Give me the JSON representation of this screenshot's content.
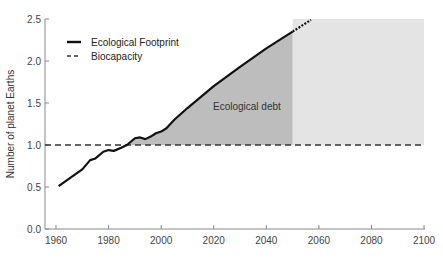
{
  "chart_data": {
    "type": "line",
    "title": "",
    "xlabel": "",
    "ylabel": "Number of planet Earths",
    "xlim": [
      1955,
      2100
    ],
    "ylim": [
      0.0,
      2.5
    ],
    "x_ticks": [
      1960,
      1980,
      2000,
      2020,
      2040,
      2060,
      2080,
      2100
    ],
    "y_ticks": [
      0.0,
      0.5,
      1.0,
      1.5,
      2.0,
      2.5
    ],
    "x_tick_labels": [
      "1960",
      "1980",
      "2000",
      "2020",
      "2040",
      "2060",
      "2080",
      "2100"
    ],
    "y_tick_labels": [
      "0.0",
      "0.5",
      "1.0",
      "1.5",
      "2.0",
      "2.5"
    ],
    "grid": false,
    "legend_position": "upper left",
    "legend": [
      {
        "label": "Ecological Footprint",
        "style": "solid"
      },
      {
        "label": "Biocapacity",
        "style": "dashed"
      }
    ],
    "series": [
      {
        "name": "Ecological Footprint",
        "style": "solid",
        "x": [
          1961,
          1965,
          1970,
          1973,
          1975,
          1978,
          1980,
          1982,
          1985,
          1987,
          1990,
          1992,
          1994,
          1996,
          1998,
          2000,
          2002,
          2005,
          2010,
          2020,
          2030,
          2040,
          2050
        ],
        "values": [
          0.51,
          0.6,
          0.71,
          0.82,
          0.84,
          0.92,
          0.94,
          0.93,
          0.97,
          1.0,
          1.08,
          1.09,
          1.07,
          1.1,
          1.14,
          1.16,
          1.2,
          1.3,
          1.44,
          1.7,
          1.93,
          2.15,
          2.35
        ]
      },
      {
        "name": "Ecological Footprint (projection)",
        "style": "dotted",
        "x": [
          2050,
          2057
        ],
        "values": [
          2.35,
          2.49
        ]
      },
      {
        "name": "Biocapacity",
        "style": "dashed",
        "x": [
          1955,
          2100
        ],
        "values": [
          1.0,
          1.0
        ]
      }
    ],
    "annotations": [
      {
        "text": "Ecological debt",
        "x": 2026,
        "y": 1.55,
        "note": "shaded area between footprint and biocapacity, 1987-2050"
      }
    ],
    "shaded_regions": [
      {
        "name": "ecological-debt",
        "x_range": [
          1987,
          2050
        ],
        "color": "#b9b9b9"
      },
      {
        "name": "future-region",
        "x_range": [
          2050,
          2100
        ],
        "y_range": [
          1.0,
          2.5
        ],
        "color": "#e3e3e3"
      }
    ]
  },
  "colors": {
    "footprint_line": "#111111",
    "biocapacity_line": "#333333",
    "debt_fill": "#bdbdbd",
    "future_fill": "#e4e4e4",
    "axis": "#888888"
  }
}
